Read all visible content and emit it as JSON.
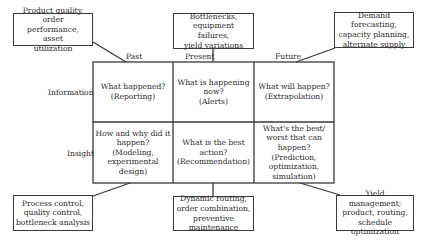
{
  "columns": [
    "Past",
    "Present",
    "Future"
  ],
  "rows": [
    "Information",
    "Insight"
  ],
  "cells": {
    "info_past": "What happened?\n(Reporting)",
    "info_present": "What is happening\nnow?\n(Alerts)",
    "info_future": "What will happen?\n(Extrapolation)",
    "insight_past": "How and why did it\nhappen?\n(Modeling,\nexperimental design)",
    "insight_present": "What is the best\naction?\n(Recommendation)",
    "insight_future": "What's the best/\nworst that can\nhappen? (Prediction,\noptimization,\nsimulation)"
  },
  "callouts": {
    "top_left": "Product quality, order\nperformance, asset\nutilization",
    "top_center": "Bottlenecks,\nequipment failures,\nyield variations",
    "top_right": "Demand forecasting,\ncapacity planning,\nalternate supply",
    "bottom_left": "Process control,\nquality control,\nbottleneck analysis",
    "bottom_center": "Dynamic routing,\norder combination,\npreventive maintenance",
    "bottom_right": "Yield management;\nproduct, routing,\nschedule optimization"
  }
}
